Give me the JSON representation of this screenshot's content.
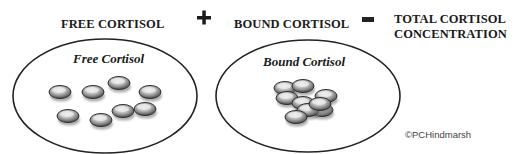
{
  "equation": {
    "term1": "FREE CORTISOL",
    "operator1": "+",
    "term2": "BOUND CORTISOL",
    "operator2": "=",
    "result_line1": "TOTAL CORTISOL",
    "result_line2": "CONCENTRATION"
  },
  "pools": [
    {
      "label": "Free Cortisol",
      "particle_count": 8,
      "arrangement": "dispersed"
    },
    {
      "label": "Bound Cortisol",
      "particle_count": 9,
      "arrangement": "clustered"
    }
  ],
  "copyright": "©PCHindmarsh",
  "colors": {
    "text": "#1a1a1a",
    "outline": "#222222",
    "particle_dark": "#3a3a3a",
    "particle_light": "#e8e8e8"
  }
}
